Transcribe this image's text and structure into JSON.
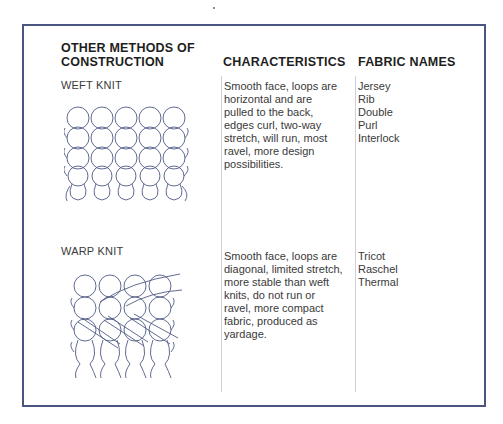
{
  "table": {
    "headers": {
      "methods_line1": "OTHER METHODS OF",
      "methods_line2": "CONSTRUCTION",
      "characteristics": "CHARACTERISTICS",
      "fabric_names": "FABRIC NAMES"
    },
    "rows": [
      {
        "method": "WEFT KNIT",
        "diagram_icon": "weft-knit-diagram",
        "characteristics_lines": [
          "Smooth face, loops are",
          "horizontal and are",
          "pulled to the back,",
          "edges curl, two-way",
          "stretch, will run, most",
          "ravel, more design",
          "possibilities."
        ],
        "fabric_names": [
          "Jersey",
          "Rib",
          "Double",
          "Purl",
          "Interlock"
        ]
      },
      {
        "method": "WARP KNIT",
        "diagram_icon": "warp-knit-diagram",
        "characteristics_lines": [
          "Smooth face, loops are",
          "diagonal, limited stretch,",
          "more stable than weft",
          "knits, do not run or",
          "ravel, more compact",
          "fabric, produced as",
          "yardage."
        ],
        "fabric_names": [
          "Tricot",
          "Raschel",
          "Thermal"
        ]
      }
    ]
  },
  "colors": {
    "frame": "#4a5680",
    "diagram_stroke": "#4f5a86",
    "divider": "#cfcfd4",
    "header_text": "#1e1e1e",
    "body_text": "#3a3a3a"
  }
}
